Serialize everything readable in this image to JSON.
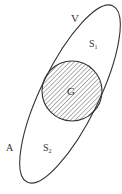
{
  "diagram": {
    "labels": {
      "outer_region": "V",
      "upper_region": "S",
      "upper_sub": "1",
      "inner_circle": "G",
      "boundary": "A",
      "lower_region": "S",
      "lower_sub": "2"
    },
    "colors": {
      "stroke": "#333333",
      "hatch": "#555555",
      "background": "#ffffff"
    }
  }
}
